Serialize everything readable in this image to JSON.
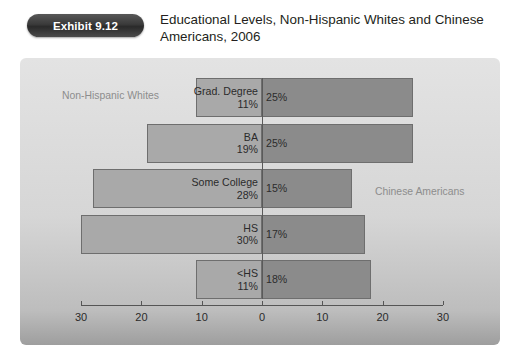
{
  "header": {
    "badge_label": "Exhibit 9.12",
    "title": "Educational Levels, Non-Hispanic Whites and Chinese Americans, 2006"
  },
  "annotations": {
    "left_series_note": "Non-Hispanic Whites",
    "right_series_note": "Chinese Americans"
  },
  "colors": {
    "left_bar": "#a9a9a9",
    "right_bar": "#8b8b8b",
    "panel_background": "#d6d6d6",
    "badge_background": "#3a3a3a",
    "text": "#2b2b2b",
    "note_text": "#8d8d8d",
    "axis": "#555555"
  },
  "chart_data": {
    "type": "bar",
    "orientation": "horizontal",
    "layout": "diverging-population-pyramid",
    "title": "Educational Levels, Non-Hispanic Whites and Chinese Americans, 2006",
    "xlabel": "",
    "ylabel": "",
    "categories": [
      "Grad. Degree",
      "BA",
      "Some College",
      "HS",
      "<HS"
    ],
    "series": [
      {
        "name": "Non-Hispanic Whites",
        "side": "left",
        "values": [
          11,
          19,
          28,
          30,
          11
        ],
        "labels": [
          "11%",
          "19%",
          "28%",
          "30%",
          "11%"
        ]
      },
      {
        "name": "Chinese Americans",
        "side": "right",
        "values": [
          25,
          25,
          15,
          17,
          18
        ],
        "labels": [
          "25%",
          "25%",
          "15%",
          "17%",
          "18%"
        ]
      }
    ],
    "axis_ticks_left": [
      "30",
      "20",
      "10"
    ],
    "axis_ticks_center": "0",
    "axis_ticks_right": [
      "10",
      "20",
      "30"
    ],
    "axis_tick_values": [
      30,
      20,
      10,
      0,
      10,
      20,
      30
    ],
    "xlim": [
      -30,
      30
    ],
    "grid": false,
    "legend_position": "inline-annotations"
  }
}
